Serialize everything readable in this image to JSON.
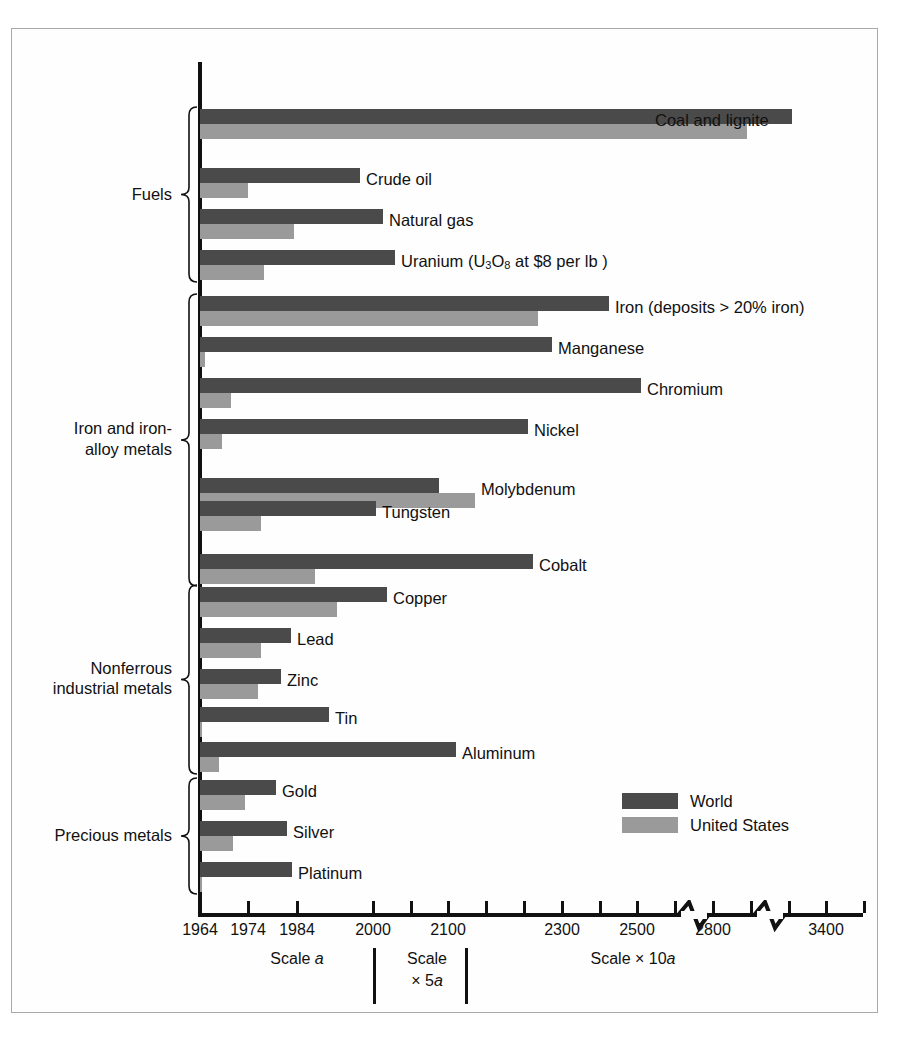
{
  "figure": {
    "legend": {
      "items": [
        {
          "label": "World",
          "color": "#4a4a4a",
          "key": "world"
        },
        {
          "label": "United States",
          "color": "#9a9a9a",
          "key": "us"
        }
      ]
    },
    "scale_captions": [
      {
        "text": "Scale a",
        "plain": "Scale ",
        "italic": "a"
      },
      {
        "text": "Scale\n× 5a",
        "line1": "Scale",
        "line2": "× 5a"
      },
      {
        "text": "Scale × 10a",
        "plain": "Scale × 10",
        "italic": "a"
      }
    ]
  },
  "chart_data": {
    "type": "bar",
    "orientation": "horizontal",
    "title": "",
    "subtitle": "",
    "xlabel": "",
    "ylabel": "",
    "grid": false,
    "legend_position": "bottom-right",
    "legend": [
      "World",
      "United States"
    ],
    "axis": {
      "tick_labels": [
        "1964",
        "1974",
        "1984",
        "2000",
        "2100",
        "2300",
        "2500",
        "2800",
        "3400"
      ],
      "tick_values": [
        1964,
        1974,
        1984,
        2000,
        2100,
        2300,
        2500,
        2800,
        3400
      ],
      "tick_px": [
        200,
        248,
        297,
        373,
        448,
        562,
        637,
        713,
        826
      ],
      "minor_tick_px": [
        411,
        486,
        524,
        600,
        675,
        751,
        789,
        864
      ],
      "axis_breaks_px": [
        694,
        770
      ],
      "note": "Projected year of depletion of reserves. Three scale zones: Scale a (1964-1984), Scale x 5a (2000-2100), Scale x 10a (2300-3400)."
    },
    "groups": [
      {
        "name": "Fuels",
        "label": "Fuels",
        "items": [
          {
            "name": "Coal and lignite",
            "label": "Coal and lignite",
            "world": 3300,
            "us": 2870,
            "world_px": 792,
            "us_px": 747,
            "label_anchor_px": 655,
            "label_y": 118
          },
          {
            "name": "Crude oil",
            "label": "Crude oil",
            "world": 1993,
            "us": 1974,
            "world_px": 360,
            "us_px": 248,
            "label_anchor_px": 366,
            "label_y": 177
          },
          {
            "name": "Natural gas",
            "label": "Natural gas",
            "world": 2005,
            "us": 1984,
            "world_px": 383,
            "us_px": 294,
            "label_anchor_px": 389,
            "label_y": 218
          },
          {
            "name": "Uranium (U3O8 at $8 per lb)",
            "label": "Uranium (U3O8 at $8 per lb )",
            "world": 2010,
            "us": 1977,
            "world_px": 395,
            "us_px": 264,
            "label_anchor_px": 401,
            "label_y": 259
          }
        ]
      },
      {
        "name": "Iron and iron-alloy metals",
        "label": "Iron and iron-\nalloy metals",
        "items": [
          {
            "name": "Iron (deposits > 20% iron)",
            "label": "Iron (deposits > 20% iron)",
            "world": 2380,
            "us": 2200,
            "world_px": 609,
            "us_px": 538,
            "label_anchor_px": 615,
            "label_y": 305
          },
          {
            "name": "Manganese",
            "label": "Manganese",
            "world": 2230,
            "us": 1965,
            "world_px": 552,
            "us_px": 205,
            "label_anchor_px": 558,
            "label_y": 346
          },
          {
            "name": "Chromium",
            "label": "Chromium",
            "world": 2495,
            "us": 1970,
            "world_px": 641,
            "us_px": 231,
            "label_anchor_px": 647,
            "label_y": 387
          },
          {
            "name": "Nickel",
            "label": "Nickel",
            "world": 2175,
            "us": 1968,
            "world_px": 528,
            "us_px": 222,
            "label_anchor_px": 534,
            "label_y": 428
          },
          {
            "name": "Molybdenum",
            "label": "Molybdenum",
            "world": 2087,
            "us": 2125,
            "world_px": 439,
            "us_px": 475,
            "label_anchor_px": 481,
            "label_y": 487
          },
          {
            "name": "Tungsten",
            "label": "Tungsten",
            "world": 2000,
            "us": 1976,
            "world_px": 376,
            "us_px": 261,
            "label_anchor_px": 382,
            "label_y": 510
          },
          {
            "name": "Cobalt",
            "label": "Cobalt",
            "world": 2185,
            "us": 1988,
            "world_px": 533,
            "us_px": 315,
            "label_anchor_px": 539,
            "label_y": 563
          }
        ]
      },
      {
        "name": "Nonferrous industrial metals",
        "label": "Nonferrous\nindustrial metals",
        "items": [
          {
            "name": "Copper",
            "label": "Copper",
            "world": 2007,
            "us": 1990,
            "world_px": 387,
            "us_px": 337,
            "label_anchor_px": 393,
            "label_y": 596
          },
          {
            "name": "Lead",
            "label": "Lead",
            "world": 1983,
            "us": 1976,
            "world_px": 291,
            "us_px": 261,
            "label_anchor_px": 297,
            "label_y": 637
          },
          {
            "name": "Zinc",
            "label": "Zinc",
            "world": 1981,
            "us": 1976,
            "world_px": 281,
            "us_px": 258,
            "label_anchor_px": 287,
            "label_y": 678
          },
          {
            "name": "Tin",
            "label": "Tin",
            "world": 1991,
            "us": 1964,
            "world_px": 329,
            "us_px": 200,
            "label_anchor_px": 335,
            "label_y": 716
          },
          {
            "name": "Aluminum",
            "label": "Aluminum",
            "world": 2108,
            "us": 1967,
            "world_px": 456,
            "us_px": 219,
            "label_anchor_px": 462,
            "label_y": 751
          }
        ]
      },
      {
        "name": "Precious metals",
        "label": "Precious metals",
        "items": [
          {
            "name": "Gold",
            "label": "Gold",
            "world": 1980,
            "us": 1973,
            "world_px": 276,
            "us_px": 245,
            "label_anchor_px": 282,
            "label_y": 789
          },
          {
            "name": "Silver",
            "label": "Silver",
            "world": 1986,
            "us": 1971,
            "world_px": 287,
            "us_px": 233,
            "label_anchor_px": 293,
            "label_y": 830
          },
          {
            "name": "Platinum",
            "label": "Platinum",
            "world": 1986,
            "us": 1964,
            "world_px": 292,
            "us_px": 200,
            "label_anchor_px": 298,
            "label_y": 871
          }
        ]
      }
    ]
  }
}
